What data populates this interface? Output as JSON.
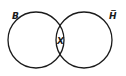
{
  "diagram": {
    "type": "venn",
    "sets": [
      {
        "label": "B",
        "cx": 36,
        "cy": 40,
        "r": 28
      },
      {
        "label": "H̅",
        "cx": 84,
        "cy": 40,
        "r": 28
      }
    ],
    "intersection_label": "X",
    "stroke_color": "#1a1a1a"
  }
}
